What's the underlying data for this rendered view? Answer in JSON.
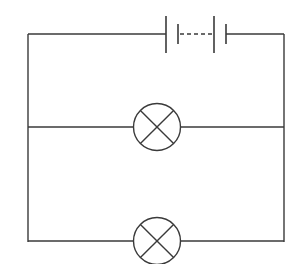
{
  "diagram": {
    "type": "circuit",
    "components": [
      {
        "id": "battery",
        "symbol": "battery-of-cells",
        "position": "top wire",
        "cells": 2,
        "dashed_link": true
      },
      {
        "id": "lamp-1",
        "symbol": "lamp",
        "position": "middle branch"
      },
      {
        "id": "lamp-2",
        "symbol": "lamp",
        "position": "bottom branch"
      }
    ],
    "connections": "two lamps connected in parallel across the battery",
    "colors": {
      "line": "#3a3a3a",
      "background": "#ffffff"
    }
  }
}
